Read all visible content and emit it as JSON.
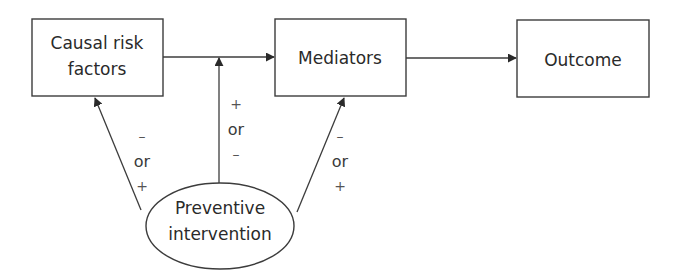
{
  "diagram": {
    "nodes": {
      "causal": {
        "line1": "Causal risk",
        "line2": "factors"
      },
      "mediators": {
        "label": "Mediators"
      },
      "outcome": {
        "label": "Outcome"
      },
      "intervention": {
        "line1": "Preventive",
        "line2": "intervention"
      }
    },
    "edges": {
      "left": {
        "top": "–",
        "mid": "or",
        "bottom": "+"
      },
      "middle": {
        "top": "+",
        "mid": "or",
        "bottom": "–"
      },
      "right": {
        "top": "–",
        "mid": "or",
        "bottom": "+"
      }
    },
    "colors": {
      "stroke": "#3c3c3c",
      "text": "#2a2a2a",
      "background": "#ffffff"
    }
  }
}
